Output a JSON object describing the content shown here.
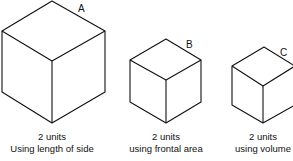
{
  "figure": {
    "cubes": [
      {
        "id": "A",
        "label": "A",
        "caption_line1": "2 units",
        "caption_line2": "Using length of side"
      },
      {
        "id": "B",
        "label": "B",
        "caption_line1": "2 units",
        "caption_line2": "using frontal area"
      },
      {
        "id": "C",
        "label": "C",
        "caption_line1": "2 units",
        "caption_line2": "using volume"
      }
    ]
  }
}
